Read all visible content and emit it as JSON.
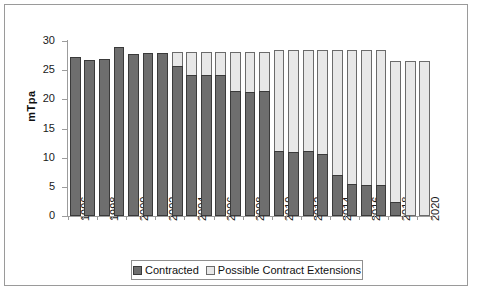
{
  "chart_data": {
    "type": "bar",
    "stacked": true,
    "title": "",
    "xlabel": "",
    "ylabel": "mTpa",
    "ylim": [
      0,
      30
    ],
    "yticks": [
      0,
      5,
      10,
      15,
      20,
      25,
      30
    ],
    "grid": false,
    "legend_position": "bottom",
    "categories": [
      "1996",
      "1997",
      "1998",
      "1999",
      "2000",
      "2001",
      "2002",
      "2003",
      "2004",
      "2005",
      "2006",
      "2007",
      "2008",
      "2009",
      "2010",
      "2011",
      "2012",
      "2013",
      "2014",
      "2015",
      "2016",
      "2017",
      "2018",
      "2019",
      "2020"
    ],
    "tick_labels": [
      "1996",
      "",
      "1998",
      "",
      "2000",
      "",
      "2002",
      "",
      "2004",
      "",
      "2006",
      "",
      "2008",
      "",
      "2010",
      "",
      "2012",
      "",
      "2014",
      "",
      "2016",
      "",
      "2018",
      "",
      "2020"
    ],
    "series": [
      {
        "name": "Contracted",
        "color": "#6e6e6e",
        "values": [
          27.3,
          26.7,
          27.0,
          29.0,
          27.8,
          27.9,
          27.9,
          25.8,
          24.2,
          24.2,
          24.2,
          21.5,
          21.3,
          21.5,
          11.1,
          11.0,
          11.1,
          10.7,
          7.1,
          5.5,
          5.3,
          5.3,
          2.4,
          0.0,
          0.0
        ]
      },
      {
        "name": "Possible Contract Extensions",
        "color": "#e8e8e8",
        "values": [
          0.0,
          0.0,
          0.0,
          0.0,
          0.0,
          0.0,
          0.0,
          2.4,
          3.9,
          3.9,
          3.9,
          6.6,
          6.8,
          6.6,
          17.4,
          17.5,
          17.4,
          17.8,
          21.4,
          23.0,
          23.2,
          23.2,
          24.2,
          26.6,
          26.6
        ]
      }
    ],
    "totals": [
      27.3,
      26.7,
      27.0,
      29.0,
      27.8,
      27.9,
      27.9,
      28.2,
      28.1,
      28.1,
      28.1,
      28.1,
      28.1,
      28.1,
      28.5,
      28.5,
      28.5,
      28.5,
      28.5,
      28.5,
      28.5,
      28.5,
      26.6,
      26.6,
      26.6
    ]
  }
}
